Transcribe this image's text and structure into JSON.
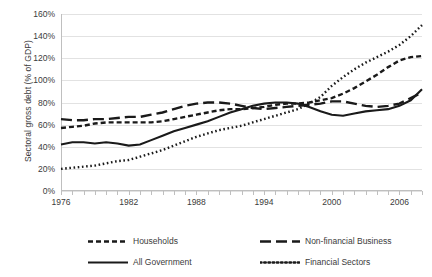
{
  "chart_data": {
    "type": "line",
    "title": "",
    "xlabel": "",
    "ylabel": "Sectoral gross debt (% of GDP)",
    "xlim": [
      1976,
      2008
    ],
    "ylim": [
      0,
      160
    ],
    "grid": true,
    "legend_position": "bottom",
    "y_ticks": [
      "0%",
      "20%",
      "40%",
      "60%",
      "80%",
      "100%",
      "120%",
      "140%",
      "160%"
    ],
    "y_tick_values": [
      0,
      20,
      40,
      60,
      80,
      100,
      120,
      140,
      160
    ],
    "x_ticks": [
      "1976",
      "1982",
      "1988",
      "1994",
      "2000",
      "2006"
    ],
    "x_tick_values": [
      1976,
      1982,
      1988,
      1994,
      2000,
      2006
    ],
    "x": [
      1976,
      1977,
      1978,
      1979,
      1980,
      1981,
      1982,
      1983,
      1984,
      1985,
      1986,
      1987,
      1988,
      1989,
      1990,
      1991,
      1992,
      1993,
      1994,
      1995,
      1996,
      1997,
      1998,
      1999,
      2000,
      2001,
      2002,
      2003,
      2004,
      2005,
      2006,
      2007,
      2008
    ],
    "series": [
      {
        "name": "Households",
        "style": "dashed",
        "color": "#1a1a1a",
        "values": [
          57,
          58,
          59,
          61,
          62,
          62,
          62,
          62,
          62,
          63,
          65,
          67,
          69,
          71,
          73,
          74,
          74,
          75,
          76,
          78,
          79,
          79,
          80,
          82,
          84,
          88,
          93,
          99,
          105,
          112,
          118,
          121,
          122
        ]
      },
      {
        "name": "Non-financial Business",
        "style": "long-dashed",
        "color": "#1a1a1a",
        "values": [
          65,
          64,
          64,
          65,
          65,
          66,
          67,
          67,
          69,
          71,
          74,
          77,
          79,
          80,
          80,
          79,
          77,
          75,
          74,
          75,
          76,
          77,
          78,
          79,
          81,
          81,
          79,
          77,
          76,
          77,
          79,
          84,
          89
        ]
      },
      {
        "name": "All Government",
        "style": "solid",
        "color": "#1a1a1a",
        "values": [
          42,
          44,
          44,
          43,
          44,
          43,
          41,
          42,
          46,
          50,
          54,
          57,
          60,
          63,
          67,
          71,
          74,
          77,
          79,
          80,
          80,
          79,
          76,
          72,
          69,
          68,
          70,
          72,
          73,
          74,
          77,
          82,
          92
        ]
      },
      {
        "name": "Financial Sectors",
        "style": "dotted",
        "color": "#1a1a1a",
        "values": [
          20,
          21,
          22,
          23,
          25,
          27,
          28,
          31,
          34,
          37,
          41,
          45,
          49,
          52,
          55,
          57,
          59,
          62,
          65,
          68,
          71,
          74,
          79,
          85,
          95,
          103,
          110,
          116,
          121,
          126,
          132,
          140,
          150
        ]
      }
    ]
  },
  "legend": {
    "items": [
      {
        "label": "Households",
        "style": "dashed"
      },
      {
        "label": "Non-financial Business",
        "style": "long-dashed"
      },
      {
        "label": "All Government",
        "style": "solid"
      },
      {
        "label": "Financial Sectors",
        "style": "dotted"
      }
    ]
  }
}
